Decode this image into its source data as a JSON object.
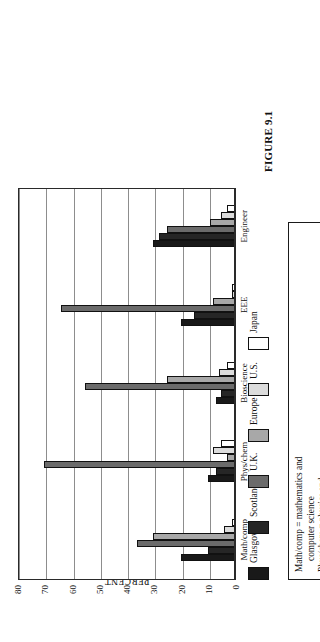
{
  "figure": {
    "caption": "FIGURE 9.1"
  },
  "axes": {
    "ylabel": "PERCENT",
    "yticks": [
      "0",
      "10",
      "20",
      "30",
      "40",
      "50",
      "60",
      "70",
      "80"
    ]
  },
  "legend": {
    "items": [
      {
        "label": "Glasgow",
        "color": "#191919"
      },
      {
        "label": "Scotland",
        "color": "#262626"
      },
      {
        "label": "U.K.",
        "color": "#6b6b6b"
      },
      {
        "label": "Europe",
        "color": "#a8a8a8"
      },
      {
        "label": "U.S.",
        "color": "#dcdcdc"
      },
      {
        "label": "Japan",
        "color": "#ffffff"
      }
    ]
  },
  "definitions": [
    {
      "text": "Math/comp = mathematics and",
      "cont": "computer science"
    },
    {
      "text": "Phys/chem = physics and",
      "cont": "bioengineering"
    },
    {
      "text": "Bioscience = bioscience and",
      "cont": "bioengineering"
    },
    {
      "text": "EEE = electronics and electrical",
      "cont": ""
    }
  ],
  "chart_data": {
    "type": "bar",
    "title": "FIGURE 9.1",
    "xlabel": "",
    "ylabel": "PERCENT",
    "ylim": [
      0,
      80
    ],
    "grid": true,
    "legend_position": "top",
    "orientation": "vertical-rotated",
    "categories": [
      "Math/comp",
      "Phys/chem",
      "Bioscience",
      "EEE",
      "Engineer"
    ],
    "series": [
      {
        "name": "Glasgow",
        "color": "#191919",
        "values": [
          20,
          10,
          7,
          20,
          30
        ]
      },
      {
        "name": "Scotland",
        "color": "#262626",
        "values": [
          10,
          7,
          5,
          15,
          28
        ]
      },
      {
        "name": "U.K.",
        "color": "#6b6b6b",
        "values": [
          36,
          70,
          55,
          64,
          25
        ]
      },
      {
        "name": "Europe",
        "color": "#a8a8a8",
        "values": [
          30,
          3,
          25,
          8,
          9
        ]
      },
      {
        "name": "U.S.",
        "color": "#dcdcdc",
        "values": [
          4,
          8,
          6,
          1,
          5
        ]
      },
      {
        "name": "Japan",
        "color": "#ffffff",
        "values": [
          1,
          5,
          3,
          1,
          3
        ]
      }
    ]
  }
}
